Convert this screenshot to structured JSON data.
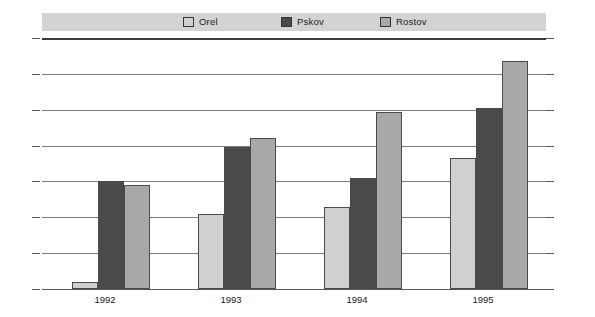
{
  "chart_data": {
    "type": "bar",
    "title": "",
    "xlabel": "",
    "ylabel": "",
    "categories": [
      "1992",
      "1993",
      "1994",
      "1995"
    ],
    "series": [
      {
        "name": "Orel",
        "color": "#d0d0d0",
        "values": [
          2,
          21,
          23,
          36.5
        ]
      },
      {
        "name": "Pskov",
        "color": "#4a4a4a",
        "values": [
          30,
          39.5,
          31,
          50.5
        ]
      },
      {
        "name": "Rostov",
        "color": "#a8a8a8",
        "values": [
          29,
          42,
          49.5,
          63.5
        ]
      }
    ],
    "ylim": [
      0,
      70
    ],
    "yticks": [
      0,
      10,
      20,
      30,
      40,
      50,
      60,
      70
    ],
    "ytick_labels_left": [
      "0",
      "10",
      "20",
      "30",
      "40",
      "50",
      "60",
      "70"
    ],
    "ytick_labels_right": [
      "0",
      "10",
      "20",
      "30",
      "40",
      "50",
      "60",
      "70"
    ],
    "grid": true,
    "legend_position": "top",
    "legend": [
      "Orel",
      "Pskov",
      "Rostov"
    ]
  },
  "colors": {
    "background": "#ffffff",
    "legend_band": "#d3d3d3",
    "gridline": "#7d7d7d",
    "axis": "#3c3c3c",
    "text": "#1a1a1a",
    "bar_border": "#4a4a4a",
    "orel": "#d0d0d0",
    "pskov": "#4a4a4a",
    "rostov": "#a8a8a8"
  }
}
